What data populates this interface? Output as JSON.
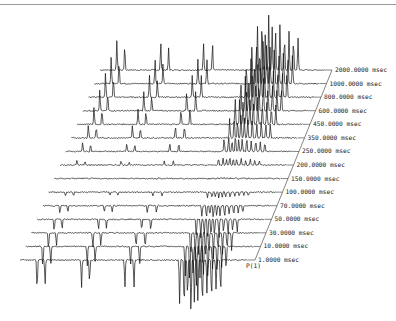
{
  "chart_data": {
    "type": "stacked-spectra",
    "title": "",
    "xlabel": "",
    "ylabel": "",
    "axis_label": "P(1)",
    "unit": "msec",
    "delays": [
      {
        "value": 1.0,
        "label": "1.0000 msec",
        "sign": -1,
        "amp": 1.0
      },
      {
        "value": 10.0,
        "label": "10.0000 msec",
        "sign": -1,
        "amp": 0.72
      },
      {
        "value": 30.0,
        "label": "30.0000 msec",
        "sign": -1,
        "amp": 0.55
      },
      {
        "value": 50.0,
        "label": "50.0000 msec",
        "sign": -1,
        "amp": 0.4
      },
      {
        "value": 70.0,
        "label": "70.0000 msec",
        "sign": -1,
        "amp": 0.25
      },
      {
        "value": 100.0,
        "label": "100.0000 msec",
        "sign": -1,
        "amp": 0.12
      },
      {
        "value": 150.0,
        "label": "150.0000 msec",
        "sign": 1,
        "amp": 0.02
      },
      {
        "value": 200.0,
        "label": "200.0000 msec",
        "sign": 1,
        "amp": 0.15
      },
      {
        "value": 250.0,
        "label": "250.0000 msec",
        "sign": 1,
        "amp": 0.3
      },
      {
        "value": 350.0,
        "label": "350.0000 msec",
        "sign": 1,
        "amp": 0.45
      },
      {
        "value": 450.0,
        "label": "450.0000 msec",
        "sign": 1,
        "amp": 0.58
      },
      {
        "value": 600.0,
        "label": "600.0000 msec",
        "sign": 1,
        "amp": 0.7
      },
      {
        "value": 800.0,
        "label": "800.0000 msec",
        "sign": 1,
        "amp": 0.8
      },
      {
        "value": 1000.0,
        "label": "1000.0000 msec",
        "sign": 1,
        "amp": 0.88
      },
      {
        "value": 2000.0,
        "label": "2000.0000 msec",
        "sign": 1,
        "amp": 1.0
      }
    ],
    "peak_positions_relative": [
      0.075,
      0.11,
      0.27,
      0.305,
      0.46,
      0.5,
      0.7,
      0.72,
      0.735,
      0.75,
      0.765,
      0.78,
      0.8,
      0.82,
      0.84,
      0.86,
      0.88
    ],
    "peak_heights_relative": [
      0.55,
      0.45,
      0.5,
      0.4,
      0.5,
      0.5,
      0.8,
      0.9,
      0.7,
      1.0,
      0.8,
      0.75,
      0.85,
      0.6,
      0.7,
      0.55,
      0.6
    ],
    "layout": {
      "front_baseline": {
        "x_start": 20,
        "x_end": 248,
        "y": 260
      },
      "back_baseline": {
        "x_start": 100,
        "x_end": 325,
        "y": 70
      },
      "grid": false,
      "legend": "none",
      "labels_position": "right of each trace along diagonal"
    }
  }
}
